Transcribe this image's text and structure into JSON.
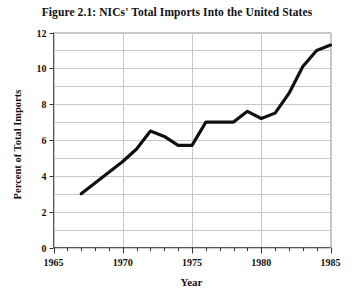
{
  "chart_data": {
    "type": "line",
    "title": "Figure 2.1: NICs' Total Imports Into the United States",
    "xlabel": "Year",
    "ylabel": "Percent of Total Imports",
    "xlim": [
      1965,
      1985
    ],
    "ylim": [
      0,
      12
    ],
    "xticks": [
      1965,
      1970,
      1975,
      1980,
      1985
    ],
    "xtick_labels": [
      "1965",
      "1970",
      "1975",
      "1980",
      "1985"
    ],
    "yticks": [
      0,
      2,
      4,
      6,
      8,
      10,
      12
    ],
    "ytick_labels": [
      "0",
      "2",
      "4",
      "6",
      "8",
      "10",
      "12"
    ],
    "x_minor_step": 1,
    "y_minor_step": 1,
    "grid": true,
    "grid_color": "#c8c8c8",
    "legend": null,
    "line_color": "#101010",
    "line_width": 3.2,
    "series": [
      {
        "name": "NICs' Total Imports",
        "x": [
          1967,
          1968,
          1969,
          1970,
          1971,
          1972,
          1973,
          1974,
          1975,
          1976,
          1977,
          1978,
          1979,
          1980,
          1981,
          1982,
          1983,
          1984,
          1985
        ],
        "values": [
          3.0,
          3.6,
          4.2,
          4.8,
          5.5,
          6.5,
          6.2,
          5.7,
          5.7,
          7.0,
          7.0,
          7.0,
          7.6,
          7.2,
          7.5,
          8.6,
          10.1,
          11.0,
          11.3
        ]
      }
    ]
  },
  "axes": {
    "y_axis_label": "Percent of Total Imports",
    "x_axis_label": "Year"
  }
}
